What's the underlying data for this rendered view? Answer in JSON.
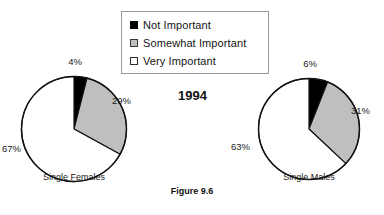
{
  "title_clipped": "Importance of Religion",
  "year_label": "1994",
  "figure_caption": "Figure 9.6",
  "legend": {
    "items": [
      {
        "label": "Not  Important",
        "swatch": "black-square-icon",
        "color": "#000000"
      },
      {
        "label": "Somewhat  Important",
        "swatch": "gray-square-icon",
        "color": "#bfbfbf"
      },
      {
        "label": "Very  Important",
        "swatch": "white-square-icon",
        "color": "#ffffff"
      }
    ]
  },
  "chart_data": {
    "type": "pie",
    "title": "Importance of Religion",
    "subtitle": "1994",
    "caption": "Figure 9.6",
    "categories": [
      "Not Important",
      "Somewhat Important",
      "Very Important"
    ],
    "colors": [
      "#000000",
      "#bfbfbf",
      "#ffffff"
    ],
    "legend_position": "top-center",
    "units": "percent",
    "start_angle_deg": 0,
    "direction": "clockwise",
    "series": [
      {
        "name": "Single Females",
        "values": [
          4,
          29,
          67
        ],
        "labels": [
          "4%",
          "29%",
          "67%"
        ]
      },
      {
        "name": "Single Males",
        "values": [
          6,
          31,
          63
        ],
        "labels": [
          "6%",
          "31%",
          "63%"
        ]
      }
    ]
  },
  "pies": {
    "left": {
      "caption": "Single Females",
      "pct_not": "4%",
      "pct_somewhat": "29%",
      "pct_very": "67%"
    },
    "right": {
      "caption": "Single Males",
      "pct_not": "6%",
      "pct_somewhat": "31%",
      "pct_very": "63%"
    }
  }
}
